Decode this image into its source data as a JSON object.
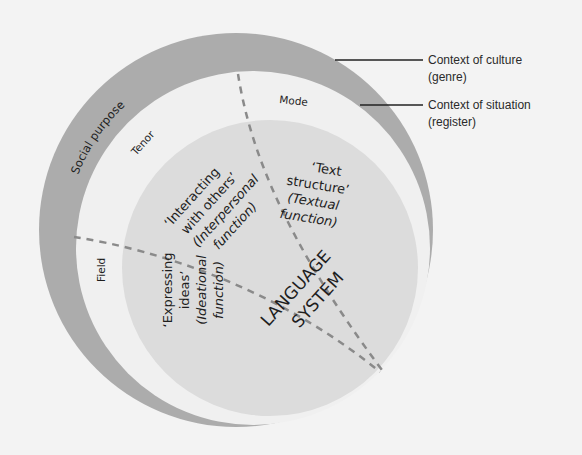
{
  "diagram": {
    "outer_ring": {
      "label": "Social purpose",
      "callout": {
        "line1": "Context of culture",
        "line2": "(genre)"
      }
    },
    "middle_ring": {
      "callout": {
        "line1": "Context of situation",
        "line2": "(register)"
      },
      "sectors": {
        "tenor": "Tenor",
        "mode": "Mode",
        "field": "Field"
      }
    },
    "inner_circle": {
      "title_line1": "LANGUAGE",
      "title_line2": "SYSTEM",
      "interpersonal": {
        "line1": "‘Interacting",
        "line2": "with others’",
        "line3": "(Interpersonal",
        "line4": "function)"
      },
      "textual": {
        "line1": "‘Text",
        "line2": "structure’",
        "line3": "(Textual",
        "line4": "function)"
      },
      "ideational": {
        "line1": "‘Expressing",
        "line2": "ideas’",
        "line3": "(Ideational",
        "line4": "function)"
      }
    },
    "colors": {
      "background": "#f3f3f3",
      "outer_ring": "#acacac",
      "middle_ring": "#f0f0f0",
      "inner_circle": "#dadada",
      "dash": "#8a8a8a",
      "text": "#1e1e1e"
    }
  }
}
